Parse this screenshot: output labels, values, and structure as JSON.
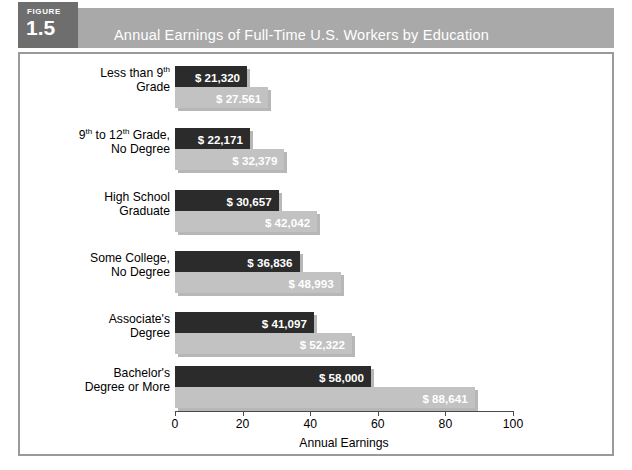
{
  "figure": {
    "badge_word": "FIGURE",
    "badge_number": "1.5",
    "title": "Annual Earnings of Full-Time U.S. Workers by Education"
  },
  "colors": {
    "header_band": "#a9a9a9",
    "badge": "#6e6e6e",
    "dark_bar": "#2b2b2b",
    "light_bar": "#c2c2c2",
    "frame_border": "#9a9a9a",
    "axis": "#4a4a4a",
    "value_text": "#ffffff"
  },
  "chart_data": {
    "type": "bar",
    "orientation": "horizontal",
    "title": "Annual Earnings of Full-Time U.S. Workers by Education",
    "xlabel": "Annual Earnings",
    "ylabel": "",
    "xlim": [
      0,
      100
    ],
    "xticks": [
      0,
      20,
      40,
      60,
      80,
      100
    ],
    "xtick_labels": [
      "0",
      "20",
      "40",
      "60",
      "80",
      "100"
    ],
    "grid": false,
    "legend": false,
    "units_note": "thousands of dollars",
    "categories": [
      "Less than 9th Grade",
      "9th to 12th Grade, No Degree",
      "High School Graduate",
      "Some College, No Degree",
      "Associate's Degree",
      "Bachelor's Degree or More"
    ],
    "series": [
      {
        "name": "dark",
        "values": [
          21.32,
          22.171,
          30.657,
          36.836,
          41.097,
          58.0
        ],
        "labels": [
          "$ 21,320",
          "$ 22,171",
          "$ 30,657",
          "$ 36,836",
          "$ 41,097",
          "$ 58,000"
        ]
      },
      {
        "name": "light",
        "values": [
          27.561,
          32.379,
          42.042,
          48.993,
          52.322,
          88.641
        ],
        "labels": [
          "$ 27.561",
          "$ 32,379",
          "$ 42,042",
          "$ 48,993",
          "$ 52,322",
          "$ 88,641"
        ]
      }
    ]
  },
  "categories_display": [
    {
      "line1": "Less than 9",
      "sup1": "th",
      "line1_tail": "",
      "line2": "Grade"
    },
    {
      "line1": "9",
      "sup1": "th",
      "line1_mid": " to 12",
      "sup2": "th",
      "line1_tail": " Grade,",
      "line2": "No Degree"
    },
    {
      "line1": "High School",
      "line2": "Graduate"
    },
    {
      "line1": "Some College,",
      "line2": "No Degree"
    },
    {
      "line1": "Associate's",
      "line2": "Degree"
    },
    {
      "line1": "Bachelor's",
      "line2": "Degree or More"
    }
  ]
}
